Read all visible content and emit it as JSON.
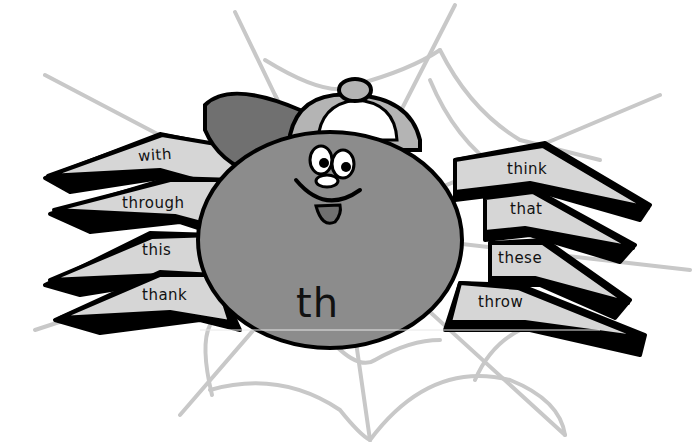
{
  "illustration": {
    "subject": "spider",
    "center_label": "th",
    "left_legs": [
      {
        "word": "with"
      },
      {
        "word": "through"
      },
      {
        "word": "this"
      },
      {
        "word": "thank"
      }
    ],
    "right_legs": [
      {
        "word": "think"
      },
      {
        "word": "that"
      },
      {
        "word": "these"
      },
      {
        "word": "throw"
      }
    ],
    "colors": {
      "background": "#ffffff",
      "web": "#c8c8c8",
      "body": "#8c8c8c",
      "leg_fill": "#d6d6d6",
      "outline": "#000000",
      "cap_brim": "#707070",
      "cap_crown": "#b4b4b4",
      "cap_front": "#ffffff"
    }
  }
}
